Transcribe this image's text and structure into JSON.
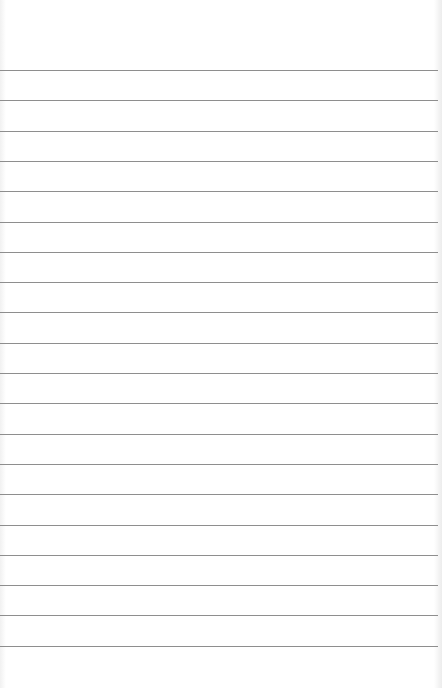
{
  "paper": {
    "type": "lined notepad page",
    "background_color": "#ffffff",
    "rule_color": "#8e8e8e",
    "rule_count": 20,
    "first_rule_y": 70,
    "rule_spacing": 30.3
  }
}
